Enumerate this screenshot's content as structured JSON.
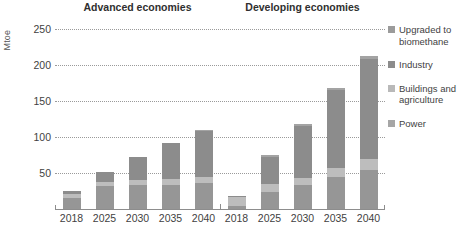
{
  "chart_data": {
    "type": "bar",
    "stacked": true,
    "title": "",
    "subtitle": "",
    "ylabel": "Mtoe",
    "xlabel": "",
    "ylim": [
      0,
      260
    ],
    "yticks": [
      50,
      100,
      150,
      200,
      250
    ],
    "grid": true,
    "legend_position": "right",
    "panels": [
      {
        "name": "Advanced economies",
        "categories": [
          "2018",
          "2025",
          "2030",
          "2035",
          "2040"
        ],
        "series": [
          {
            "name": "Power",
            "values": [
              16,
              32,
              33,
              34,
              36
            ]
          },
          {
            "name": "Buildings and agriculture",
            "values": [
              5,
              6,
              7,
              8,
              9
            ]
          },
          {
            "name": "Industry",
            "values": [
              4,
              14,
              32,
              50,
              64
            ]
          },
          {
            "name": "Upgraded to biomethane",
            "values": [
              0,
              0,
              0,
              0,
              1
            ]
          }
        ],
        "totals": [
          25,
          52,
          72,
          92,
          110
        ]
      },
      {
        "name": "Developing economies",
        "categories": [
          "2018",
          "2025",
          "2030",
          "2035",
          "2040"
        ],
        "series": [
          {
            "name": "Power",
            "values": [
              4,
              24,
              33,
              45,
              54
            ]
          },
          {
            "name": "Buildings and agriculture",
            "values": [
              13,
              11,
              10,
              12,
              15
            ]
          },
          {
            "name": "Industry",
            "values": [
              1,
              38,
              72,
              108,
              140
            ]
          },
          {
            "name": "Upgraded to biomethane",
            "values": [
              0,
              2,
              3,
              3,
              4
            ]
          }
        ],
        "totals": [
          18,
          75,
          118,
          168,
          213
        ]
      }
    ],
    "legend": [
      {
        "label": "Upgraded to biomethane",
        "color": "#9b9b9b"
      },
      {
        "label": "Industry",
        "color": "#8c8c8c"
      },
      {
        "label": "Buildings and agriculture",
        "color": "#b9b9b9"
      },
      {
        "label": "Power",
        "color": "#a6a6a6"
      }
    ],
    "colors": {
      "power": "#969696",
      "buildings_and_agriculture": "#bdbdbd",
      "industry": "#8c8c8c",
      "upgraded_to_biomethane": "#a3a3a3",
      "gridline": "#9a9a9a",
      "axis": "#8d8d8d",
      "text": "#3f3f3f"
    }
  }
}
